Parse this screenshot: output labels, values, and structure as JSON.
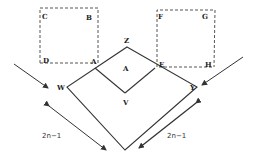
{
  "diagram": {
    "colors": {
      "stroke": "#333333",
      "dashed": "#555555",
      "text": "#222222"
    },
    "labels": {
      "C": "C",
      "B": "B",
      "D": "D",
      "A1": "A",
      "F": "F",
      "G": "G",
      "E": "E",
      "H": "H",
      "Z": "Z",
      "A": "A",
      "W": "W",
      "V": "V",
      "Y": "Y"
    },
    "dimensions": {
      "left": "2n−1",
      "right": "2n−1"
    },
    "shapes": {
      "left_dashed_square": {
        "corners": [
          "C",
          "B",
          "A",
          "D"
        ]
      },
      "right_dashed_square": {
        "corners": [
          "F",
          "G",
          "H",
          "E"
        ]
      },
      "outer_diamond": {
        "vertices": [
          "Z",
          "Y",
          "bottom",
          "W"
        ]
      },
      "inner_square": {
        "vertices": [
          "Z",
          "E",
          "V",
          "A"
        ]
      }
    }
  }
}
